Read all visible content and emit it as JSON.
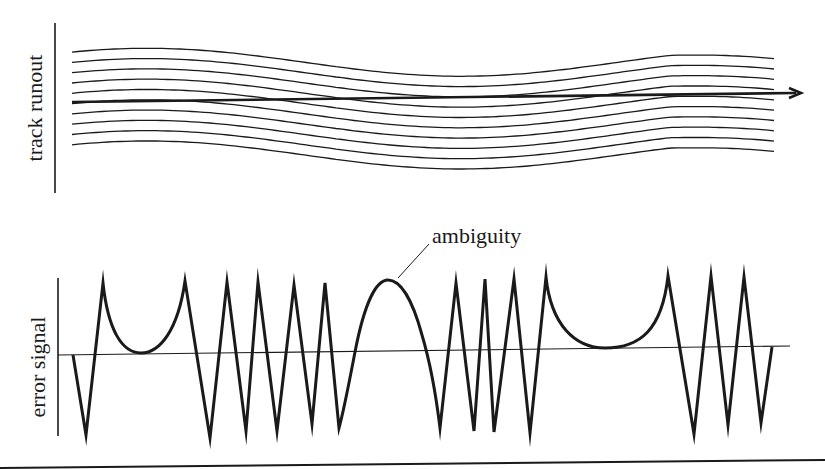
{
  "figure": {
    "background": "#ffffff",
    "ink_color": "#1a1a1a",
    "top_panel": {
      "ylabel": "track runout",
      "track_count": 10,
      "direction_arrow": "right-arrow"
    },
    "bottom_panel": {
      "ylabel": "error signal",
      "annotation": "ambiguity"
    }
  },
  "geometry": {
    "top_axis": {
      "x": 55,
      "y1": 23,
      "y2": 193
    },
    "track_start_x": 72,
    "track_end_x": 775,
    "track_first_y": 50,
    "track_spacing": 10.3,
    "arrow": {
      "x1": 72,
      "y1": 102,
      "x2": 800,
      "y2": 93
    },
    "bottom_axis": {
      "x": 58,
      "y1": 278,
      "y2": 436
    },
    "baseline": {
      "x1": 58,
      "y1": 355,
      "x2": 790,
      "y2": 346
    },
    "bottom_rule": {
      "x1": 0,
      "y1": 468,
      "x2": 825,
      "y2": 460
    }
  },
  "chart_data": {
    "type": "line",
    "title": "",
    "panels": [
      {
        "name": "track runout",
        "ylabel": "track runout",
        "description": "10 parallel wavy track lines with a straight head-path arrow cutting across them",
        "series_count": 10
      },
      {
        "name": "error signal",
        "ylabel": "error signal",
        "annotation": "ambiguity",
        "description": "sawtooth position error signal with rounded U-shaped dwell segments and one smooth hump labeled ambiguity"
      }
    ]
  }
}
